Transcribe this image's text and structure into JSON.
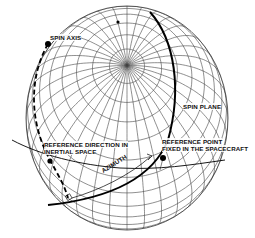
{
  "diagram": {
    "type": "celestial-sphere",
    "colors": {
      "grid": "#444444",
      "curves": "#000000",
      "background": "#ffffff"
    },
    "labels": {
      "spin_axis": "SPIN AXIS",
      "spin_plane": "SPIN PLANE",
      "ref_direction_line1": "REFERENCE DIRECTION IN",
      "ref_direction_line2": "INERTIAL SPACE",
      "ref_point_line1": "REFERENCE POINT",
      "ref_point_line2": "FIXED IN THE SPACECRAFT",
      "azimuth": "AZIMUTH"
    }
  }
}
